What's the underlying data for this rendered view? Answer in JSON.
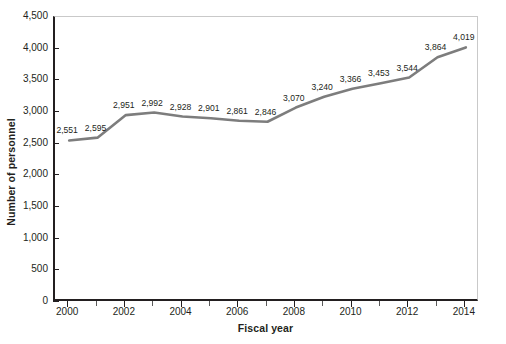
{
  "chart_data": {
    "type": "line",
    "title": "",
    "subtitle": "",
    "xlabel": "Fiscal year",
    "ylabel": "Number of personnel",
    "xlim": [
      1999.5,
      2014.5
    ],
    "ylim": [
      0,
      4500
    ],
    "grid": false,
    "legend": null,
    "line_color": "#7d7d7d",
    "axis_color": "#231f20",
    "x": [
      2000,
      2001,
      2002,
      2003,
      2004,
      2005,
      2006,
      2007,
      2008,
      2009,
      2010,
      2011,
      2012,
      2013,
      2014
    ],
    "values": [
      2551,
      2595,
      2951,
      2992,
      2928,
      2901,
      2861,
      2846,
      3070,
      3240,
      3366,
      3453,
      3544,
      3864,
      4019
    ],
    "point_labels": [
      "2,551",
      "2,595",
      "2,951",
      "2,992",
      "2,928",
      "2,901",
      "2,861",
      "2,846",
      "3,070",
      "3,240",
      "3,366",
      "3,453",
      "3,544",
      "3,864",
      "4,019"
    ],
    "ytick_values": [
      0,
      500,
      1000,
      1500,
      2000,
      2500,
      3000,
      3500,
      4000,
      4500
    ],
    "ytick_labels": [
      "0",
      "500",
      "1,000",
      "1,500",
      "2,000",
      "2,500",
      "3,000",
      "3,500",
      "4,000",
      "4,500"
    ],
    "xtick_values": [
      2000,
      2002,
      2004,
      2006,
      2008,
      2010,
      2012,
      2014
    ],
    "xtick_labels": [
      "2000",
      "2002",
      "2004",
      "2006",
      "2008",
      "2010",
      "2012",
      "2014"
    ],
    "xtick_minor_values": [
      2001,
      2003,
      2005,
      2007,
      2009,
      2011,
      2013
    ]
  }
}
